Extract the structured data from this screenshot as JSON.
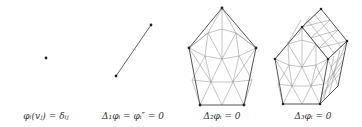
{
  "figure": {
    "panels": [
      {
        "id": "dim0",
        "type": "point",
        "caption": "φᵢ(vⱼ) = δᵢⱼ",
        "caption_x": 46
      },
      {
        "id": "dim1",
        "type": "segment",
        "caption": "Δ₁φᵢ = φᵢ″ = 0",
        "caption_x": 133
      },
      {
        "id": "dim2",
        "type": "pentagon-triangulation",
        "caption": "Δ₂φᵢ = 0",
        "caption_x": 222
      },
      {
        "id": "dim3",
        "type": "pentagonal-prism-tetrahedralization",
        "caption": "Δ₃φᵢ = 0",
        "caption_x": 313
      }
    ],
    "colors": {
      "stroke": "#555555",
      "mesh": "#8a8a8a",
      "vertex": "#222222",
      "text": "#333333"
    }
  }
}
